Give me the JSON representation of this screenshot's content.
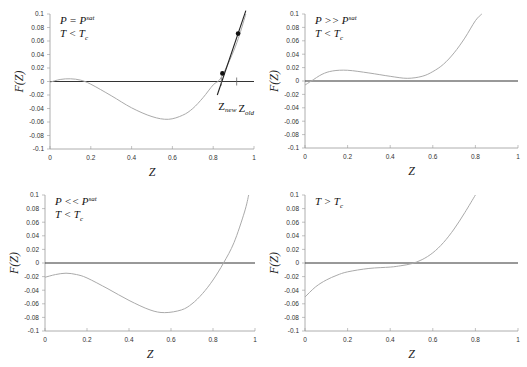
{
  "chart_data": [
    {
      "type": "line",
      "title": "",
      "annotation_lines": [
        "P = P",
        "T < T"
      ],
      "annotation_sup": "sat",
      "annotation_sub": "c",
      "xlabel": "Z",
      "ylabel": "F(Z)",
      "xlim": [
        0,
        1
      ],
      "ylim": [
        -0.1,
        0.1
      ],
      "xticks": [
        "0",
        "0.2",
        "0.4",
        "0.6",
        "0.8",
        "1"
      ],
      "yticks": [
        "0.1",
        "0.08",
        "0.06",
        "0.04",
        "0.02",
        "0",
        "-0.02",
        "-0.04",
        "-0.06",
        "-0.08",
        "-0.1"
      ],
      "series": [
        {
          "name": "F(Z)",
          "x": [
            0,
            0.05,
            0.1,
            0.15,
            0.2,
            0.3,
            0.4,
            0.5,
            0.58,
            0.65,
            0.7,
            0.75,
            0.8,
            0.83,
            0.86,
            0.9,
            0.93,
            0.96
          ],
          "y": [
            -0.001,
            0.003,
            0.004,
            0.002,
            -0.004,
            -0.021,
            -0.039,
            -0.052,
            -0.056,
            -0.05,
            -0.04,
            -0.024,
            -0.005,
            0.002,
            0.018,
            0.045,
            0.07,
            0.1
          ]
        }
      ],
      "tangent": {
        "x": [
          0.82,
          0.96
        ],
        "y": [
          -0.02,
          0.105
        ]
      },
      "points": [
        {
          "x": 0.845,
          "y": 0.012
        },
        {
          "x": 0.922,
          "y": 0.071
        }
      ],
      "markers": [
        {
          "x": 0.84,
          "label": "Z",
          "sub": "new"
        },
        {
          "x": 0.915,
          "label": "Z",
          "sub": "old"
        }
      ]
    },
    {
      "type": "line",
      "annotation_lines": [
        "P >> P",
        "T < T"
      ],
      "annotation_sup": "sat",
      "annotation_sub": "c",
      "xlabel": "Z",
      "ylabel": "F(Z)",
      "xlim": [
        0,
        1
      ],
      "ylim": [
        -0.1,
        0.1
      ],
      "xticks": [
        "0",
        "0.2",
        "0.4",
        "0.6",
        "0.8",
        "1"
      ],
      "yticks": [
        "0.1",
        "0.08",
        "0.06",
        "0.04",
        "0.02",
        "0",
        "-0.02",
        "-0.04",
        "-0.06",
        "-0.08",
        "-0.1"
      ],
      "series": [
        {
          "name": "F(Z)",
          "x": [
            0,
            0.03,
            0.08,
            0.13,
            0.2,
            0.3,
            0.4,
            0.48,
            0.55,
            0.6,
            0.65,
            0.7,
            0.75,
            0.8,
            0.83
          ],
          "y": [
            -0.006,
            0.0,
            0.01,
            0.015,
            0.016,
            0.012,
            0.007,
            0.004,
            0.007,
            0.014,
            0.025,
            0.042,
            0.064,
            0.09,
            0.1
          ]
        }
      ]
    },
    {
      "type": "line",
      "annotation_lines": [
        "P << P",
        "T < T"
      ],
      "annotation_sup": "sat",
      "annotation_sub": "c",
      "xlabel": "Z",
      "ylabel": "F(Z)",
      "xlim": [
        0,
        1
      ],
      "ylim": [
        -0.1,
        0.1
      ],
      "xticks": [
        "0",
        "0.2",
        "0.4",
        "0.6",
        "0.8",
        "1"
      ],
      "yticks": [
        "0.1",
        "0.08",
        "0.06",
        "0.04",
        "0.02",
        "0",
        "-0.02",
        "-0.04",
        "-0.06",
        "-0.08",
        "-0.1"
      ],
      "series": [
        {
          "name": "F(Z)",
          "x": [
            0,
            0.05,
            0.1,
            0.15,
            0.2,
            0.3,
            0.4,
            0.5,
            0.57,
            0.65,
            0.7,
            0.75,
            0.8,
            0.85,
            0.9,
            0.95,
            0.97
          ],
          "y": [
            -0.021,
            -0.017,
            -0.015,
            -0.017,
            -0.022,
            -0.038,
            -0.055,
            -0.069,
            -0.073,
            -0.069,
            -0.06,
            -0.045,
            -0.025,
            0.0,
            0.03,
            0.075,
            0.1
          ]
        }
      ]
    },
    {
      "type": "line",
      "annotation_lines": [
        "T > T"
      ],
      "annotation_sup": "",
      "annotation_sub": "c",
      "xlabel": "Z",
      "ylabel": "F(Z)",
      "xlim": [
        0,
        1
      ],
      "ylim": [
        -0.1,
        0.1
      ],
      "xticks": [
        "0",
        "0.2",
        "0.4",
        "0.6",
        "0.8",
        "1"
      ],
      "yticks": [
        "0.1",
        "0.08",
        "0.06",
        "0.04",
        "0.02",
        "0",
        "-0.02",
        "-0.04",
        "-0.06",
        "-0.08",
        "-0.1"
      ],
      "series": [
        {
          "name": "F(Z)",
          "x": [
            0,
            0.05,
            0.1,
            0.15,
            0.2,
            0.3,
            0.4,
            0.45,
            0.5,
            0.55,
            0.6,
            0.65,
            0.7,
            0.75,
            0.8
          ],
          "y": [
            -0.05,
            -0.035,
            -0.025,
            -0.018,
            -0.013,
            -0.008,
            -0.006,
            -0.004,
            -0.001,
            0.005,
            0.015,
            0.03,
            0.05,
            0.074,
            0.1
          ]
        }
      ]
    }
  ]
}
